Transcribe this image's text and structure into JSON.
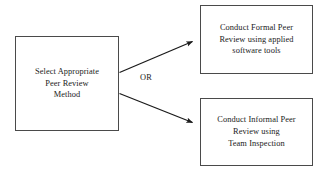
{
  "diagram": {
    "title": "Select Appropriate Peer Review Method",
    "type": "flowchart",
    "background_color": "#ffffff",
    "stroke_color": "#4a4a4a",
    "arrow_color": "#1a1a1a",
    "text_color": "#1a1a1a",
    "nodes": [
      {
        "id": "select-method",
        "name": "select-appropriate-peer-review-method",
        "label": "Select Appropriate\nPeer Review\nMethod",
        "lines": [
          "Select Appropriate",
          "Peer Review",
          "Method"
        ],
        "shape": "rectangle",
        "role": "decision-source"
      },
      {
        "id": "formal-review",
        "name": "conduct-formal-peer-review",
        "label": "Conduct Formal Peer\nReview using applied\nsoftware tools",
        "lines": [
          "Conduct Formal Peer",
          "Review using applied",
          "software tools"
        ],
        "shape": "rectangle",
        "role": "outcome"
      },
      {
        "id": "informal-review",
        "name": "conduct-informal-peer-review",
        "label": "Conduct Informal Peer\nReview using\nTeam Inspection",
        "lines": [
          "Conduct Informal Peer",
          "Review using",
          "Team Inspection"
        ],
        "shape": "rectangle",
        "role": "outcome"
      }
    ],
    "edges": [
      {
        "id": "edge-to-formal",
        "name": "arrow-select-method-to-formal-review",
        "from": "select-method",
        "to": "formal-review",
        "label": "",
        "arrowhead": "filled-triangle"
      },
      {
        "id": "edge-to-informal",
        "name": "arrow-select-method-to-informal-review",
        "from": "select-method",
        "to": "informal-review",
        "label": "",
        "arrowhead": "filled-triangle"
      }
    ],
    "edge_labels": [
      {
        "id": "or",
        "name": "edge-label-or",
        "text": "OR"
      }
    ]
  }
}
